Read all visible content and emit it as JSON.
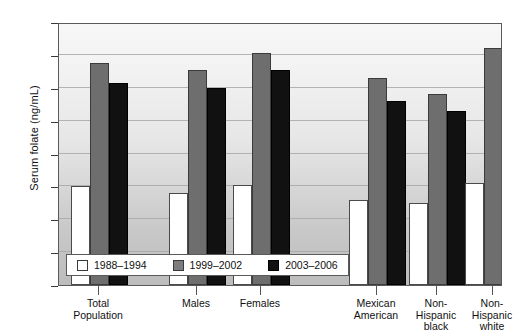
{
  "chart_data": {
    "type": "bar",
    "title": "",
    "xlabel": "",
    "ylabel": "Serum folate (ng/mL)",
    "ylim": [
      0,
      16
    ],
    "yticks": [
      0,
      2,
      4,
      6,
      8,
      10,
      12,
      14,
      16
    ],
    "grid": true,
    "legend_position": "inside-bottom-left",
    "categories": [
      "Total\nPopulation",
      "Males",
      "Females",
      "Mexican\nAmerican",
      "Non-\nHispanic\nblack",
      "Non-\nHispanic\nwhite"
    ],
    "category_lines": [
      [
        "Total",
        "Population"
      ],
      [
        "Males"
      ],
      [
        "Females"
      ],
      [
        "Mexican",
        "American"
      ],
      [
        "Non-",
        "Hispanic",
        "black"
      ],
      [
        "Non-",
        "Hispanic",
        "white"
      ]
    ],
    "series": [
      {
        "name": "1988–1994",
        "color": "#ffffff",
        "values": [
          6.0,
          5.6,
          6.1,
          5.2,
          5.0,
          6.2
        ]
      },
      {
        "name": "1999–2002",
        "color": "#6e6e6e",
        "values": [
          13.5,
          13.1,
          14.1,
          12.6,
          11.6,
          14.4
        ]
      },
      {
        "name": "2003–2006",
        "color": "#111111",
        "values": [
          12.3,
          12.0,
          13.1,
          11.2,
          10.6,
          13.2
        ]
      }
    ]
  },
  "legend": {
    "items": [
      {
        "label": "1988–1994",
        "swatch": "white-square-icon"
      },
      {
        "label": "1999–2002",
        "swatch": "gray-square-icon"
      },
      {
        "label": "2003–2006",
        "swatch": "black-square-icon"
      }
    ]
  }
}
